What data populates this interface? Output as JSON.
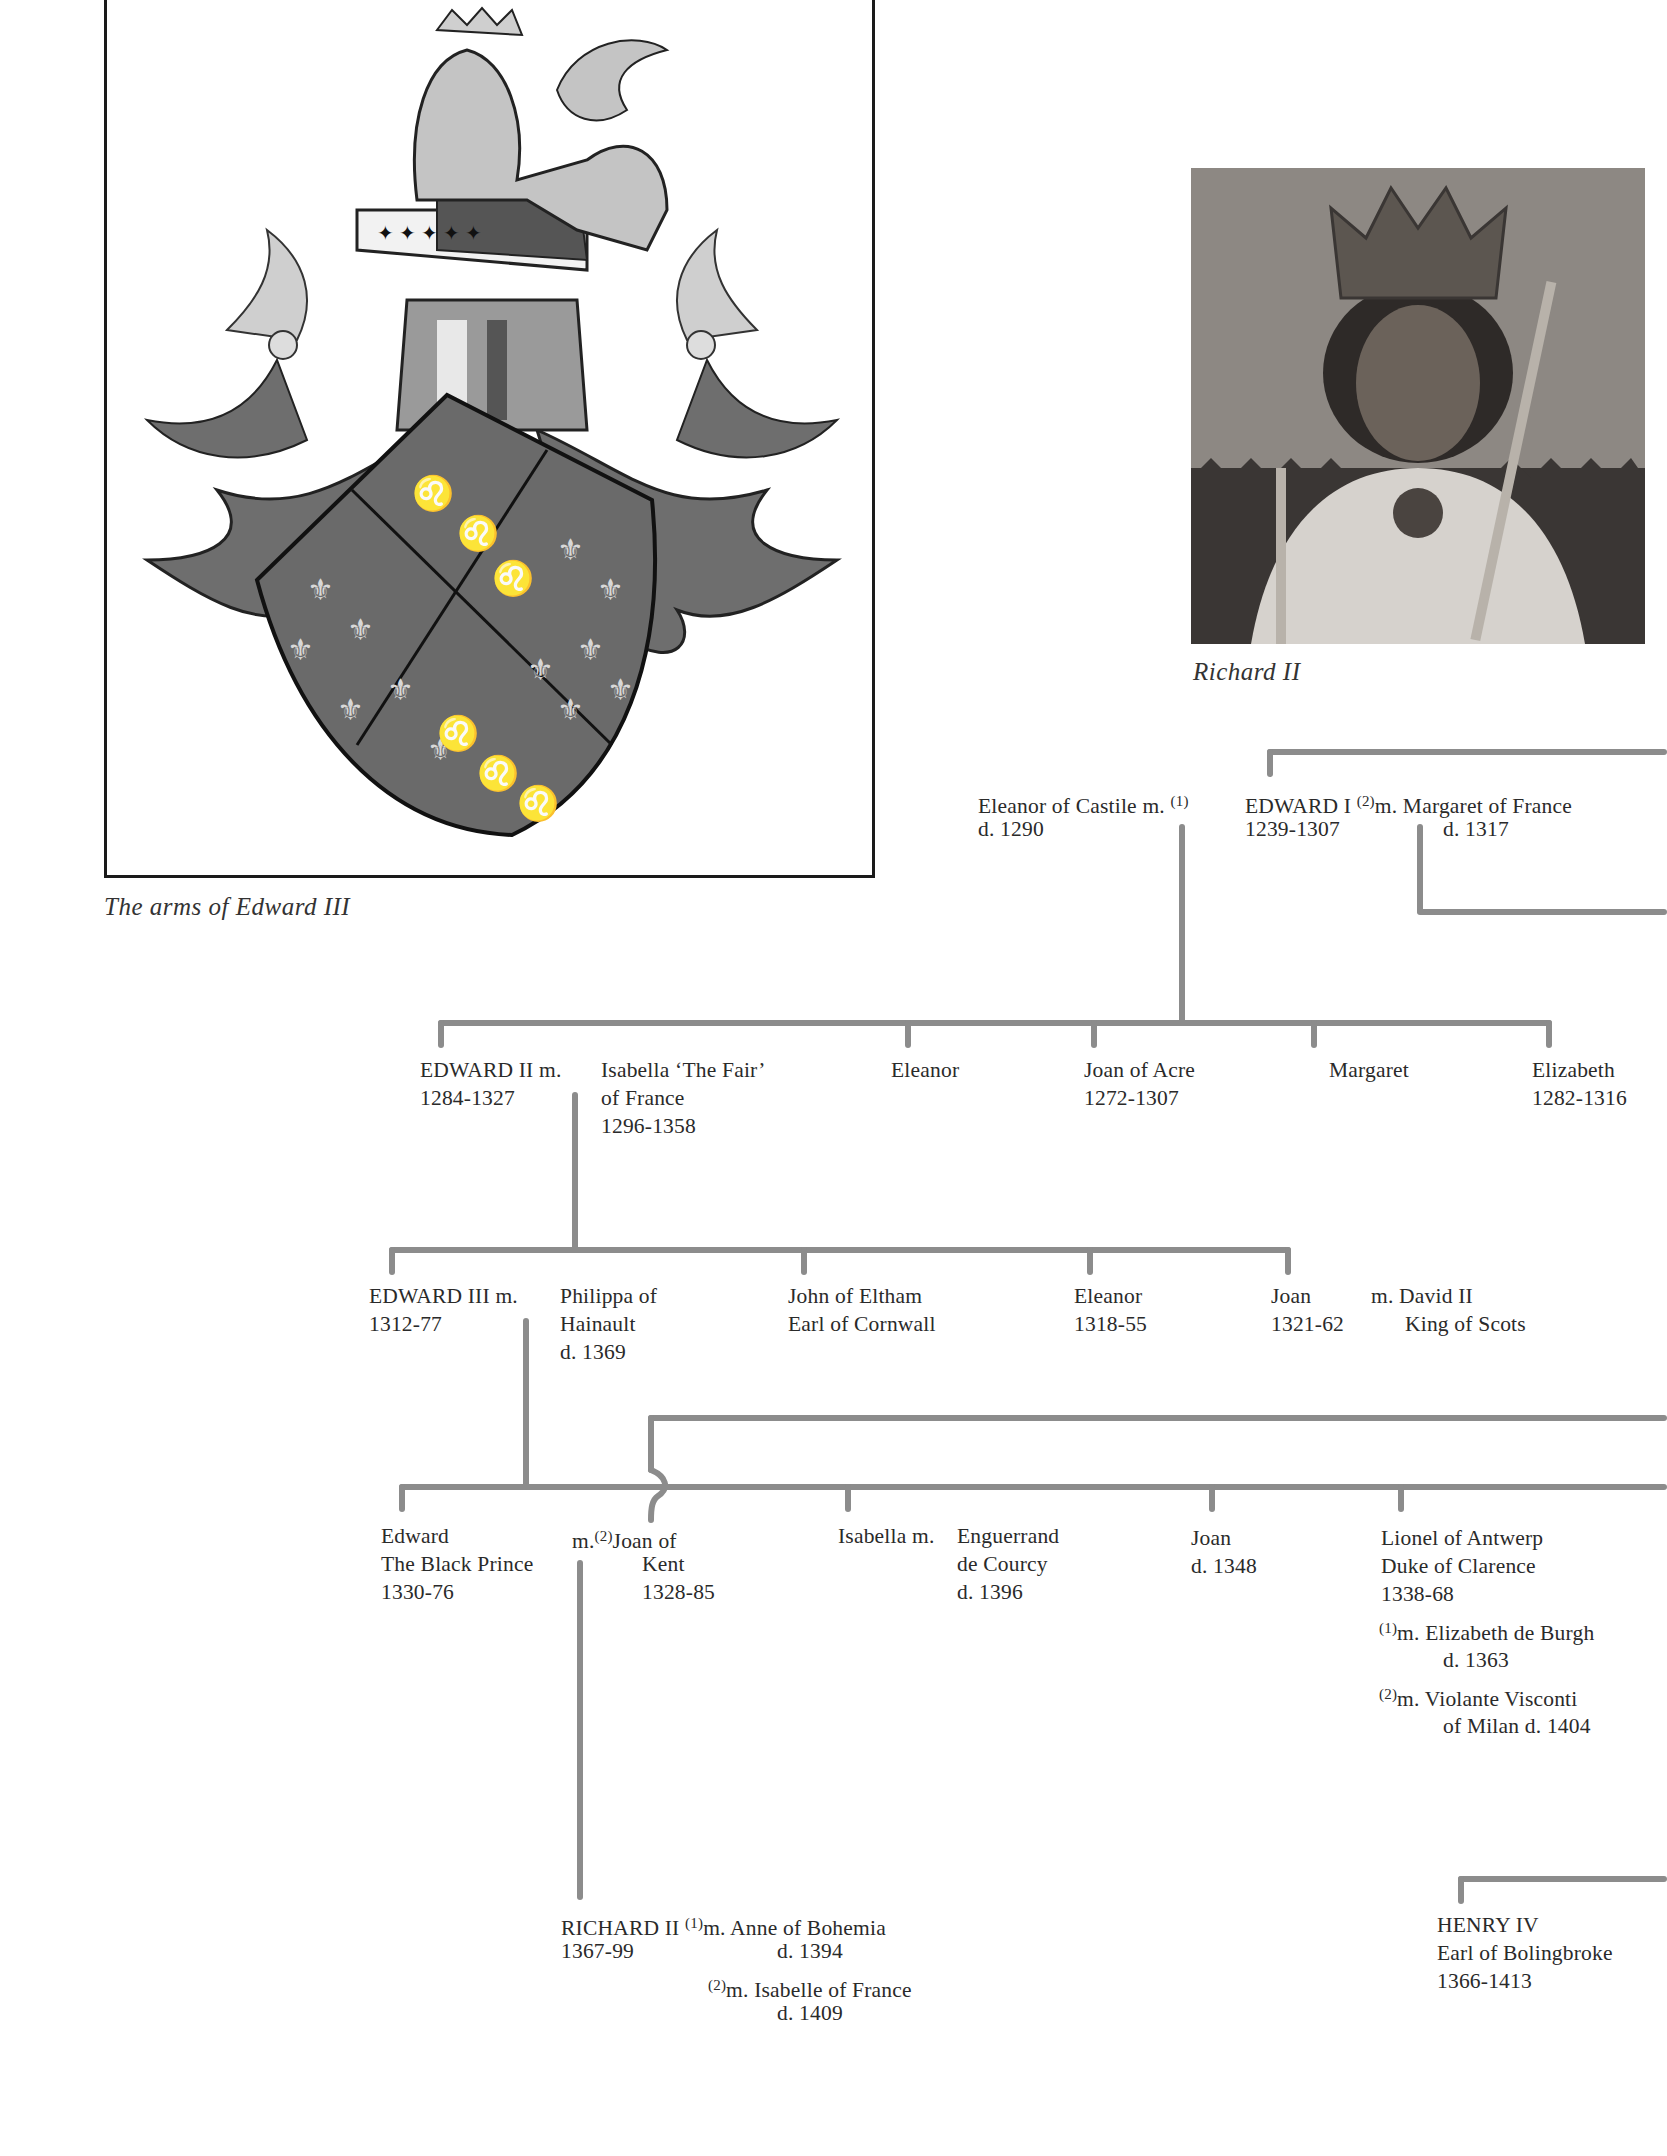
{
  "figures": {
    "arms": {
      "caption": "The arms of Edward III",
      "description": "Heraldic achievement: crowned lion crest atop helm on ermine cap of maintenance; shield quartered France ancient (fleurs-de-lis) and England (three lions passant guardant), flanked by mantling"
    },
    "portrait": {
      "caption": "Richard II",
      "description": "Painted portrait of crowned king holding sceptre and orb-staff, ermine robe"
    }
  },
  "tree": {
    "gen1": {
      "wife1": {
        "name": "Eleanor of Castile m.",
        "dates": "d. 1290"
      },
      "wife1_marker": "(1)",
      "king": {
        "name": "EDWARD I",
        "dates": "1239-1307"
      },
      "wife2_marker": "(2)",
      "wife2": {
        "name": "m. Margaret of France",
        "dates": "d. 1317"
      }
    },
    "gen2": {
      "king": {
        "name": "EDWARD II",
        "marriage": "m.",
        "dates": "1284-1327"
      },
      "spouse": {
        "line1": "Isabella ‘The Fair’",
        "line2": "of France",
        "line3": "1296-1358"
      },
      "siblings": [
        {
          "name": "Eleanor",
          "dates": ""
        },
        {
          "name": "Joan of Acre",
          "dates": "1272-1307"
        },
        {
          "name": "Margaret",
          "dates": ""
        },
        {
          "name": "Elizabeth",
          "dates": "1282-1316"
        }
      ]
    },
    "gen3": {
      "king": {
        "name": "EDWARD III m.",
        "dates": "1312-77"
      },
      "spouse": {
        "line1": "Philippa of",
        "line2": "Hainault",
        "line3": "d. 1369"
      },
      "siblings": [
        {
          "name": "John of Eltham",
          "dates": "Earl of Cornwall"
        },
        {
          "name": "Eleanor",
          "dates": "1318-55"
        },
        {
          "name": "Joan",
          "dates": "1321-62"
        }
      ],
      "joan_spouse": {
        "line1": "m. David II",
        "line2": "King of Scots"
      }
    },
    "gen4": {
      "black_prince": {
        "line1": "Edward",
        "line2": "The Black Prince",
        "line3": "1330-76"
      },
      "bp_marriage": {
        "prefix": "m.",
        "marker": "(2)",
        "line1": "Joan of",
        "line2": "Kent",
        "line3": "1328-85"
      },
      "isabella": {
        "name": "Isabella m.",
        "spouse1": "Enguerrand",
        "spouse2": "de Courcy",
        "spouse3": "d. 1396"
      },
      "joan": {
        "name": "Joan",
        "dates": "d. 1348"
      },
      "lionel": {
        "line1": "Lionel of Antwerp",
        "line2": "Duke of Clarence",
        "line3": "1338-68",
        "m1_marker": "(1)",
        "m1": "m. Elizabeth de Burgh",
        "m1_dates": "d. 1363",
        "m2_marker": "(2)",
        "m2": "m. Violante Visconti",
        "m2_dates": "of Milan d. 1404"
      }
    },
    "gen5": {
      "richard": {
        "name": "RICHARD II",
        "dates": "1367-99",
        "m1_marker": "(1)",
        "m1": "m. Anne of Bohemia",
        "m1_dates": "d. 1394",
        "m2_marker": "(2)",
        "m2": "m. Isabelle of France",
        "m2_dates": "d. 1409"
      },
      "henry": {
        "line1": "HENRY IV",
        "line2": "Earl of Bolingbroke",
        "line3": "1366-1413"
      }
    }
  },
  "colors": {
    "line": "#8c8c8c",
    "text": "#2a2a2a",
    "frame": "#1a1a1a"
  }
}
